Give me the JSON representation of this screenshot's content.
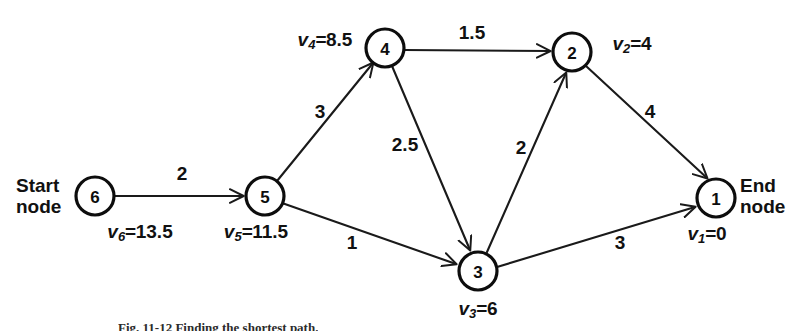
{
  "figure": {
    "caption": "Fig. 11-12  Finding the shortest path."
  },
  "terminals": {
    "start": {
      "line1": "Start",
      "line2": "node"
    },
    "end": {
      "line1": "End",
      "line2": "node"
    }
  },
  "nodes": [
    {
      "id": "6",
      "label": "6",
      "cx": 95,
      "cy": 196,
      "r": 19,
      "value_prefix": "v",
      "value_sub": "6",
      "value_eq": "=",
      "value_num": "13.5",
      "value_x": 140,
      "value_y": 233
    },
    {
      "id": "5",
      "label": "5",
      "cx": 265,
      "cy": 196,
      "r": 19,
      "value_prefix": "v",
      "value_sub": "5",
      "value_eq": "=",
      "value_num": "11.5",
      "value_x": 256,
      "value_y": 233
    },
    {
      "id": "4",
      "label": "4",
      "cx": 385,
      "cy": 48,
      "r": 19,
      "value_prefix": "v",
      "value_sub": "4",
      "value_eq": "=",
      "value_num": "8.5",
      "value_x": 325,
      "value_y": 41
    },
    {
      "id": "2",
      "label": "2",
      "cx": 572,
      "cy": 52,
      "r": 19,
      "value_prefix": "v",
      "value_sub": "2",
      "value_eq": "=",
      "value_num": "4",
      "value_x": 632,
      "value_y": 45
    },
    {
      "id": "3",
      "label": "3",
      "cx": 478,
      "cy": 271,
      "r": 19,
      "value_prefix": "v",
      "value_sub": "3",
      "value_eq": "=",
      "value_num": "6",
      "value_x": 478,
      "value_y": 310
    },
    {
      "id": "1",
      "label": "1",
      "cx": 716,
      "cy": 198,
      "r": 19,
      "value_prefix": "v",
      "value_sub": "1",
      "value_eq": "=",
      "value_num": "0",
      "value_x": 707,
      "value_y": 235
    }
  ],
  "edges": [
    {
      "from": "6",
      "to": "5",
      "weight": "2",
      "label_x": 182,
      "label_y": 174
    },
    {
      "from": "5",
      "to": "4",
      "weight": "3",
      "label_x": 320,
      "label_y": 112
    },
    {
      "from": "5",
      "to": "3",
      "weight": "1",
      "label_x": 352,
      "label_y": 243
    },
    {
      "from": "4",
      "to": "2",
      "weight": "1.5",
      "label_x": 472,
      "label_y": 33
    },
    {
      "from": "4",
      "to": "3",
      "weight": "2.5",
      "label_x": 405,
      "label_y": 145
    },
    {
      "from": "3",
      "to": "2",
      "weight": "2",
      "label_x": 521,
      "label_y": 148
    },
    {
      "from": "2",
      "to": "1",
      "weight": "4",
      "label_x": 650,
      "label_y": 112
    },
    {
      "from": "3",
      "to": "1",
      "weight": "3",
      "label_x": 620,
      "label_y": 243
    }
  ],
  "colors": {
    "ink": "#111111",
    "background": "#ffffff"
  }
}
